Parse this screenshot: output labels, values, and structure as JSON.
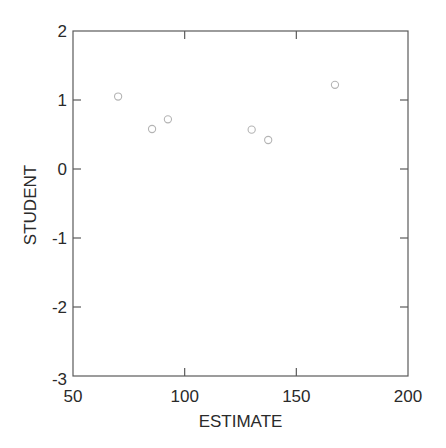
{
  "chart_data": {
    "type": "scatter",
    "title": "",
    "xlabel": "ESTIMATE",
    "ylabel": "STUDENT",
    "xlim": [
      50,
      200
    ],
    "ylim": [
      -3,
      2
    ],
    "xticks": [
      50,
      100,
      150,
      200
    ],
    "yticks": [
      2,
      1,
      0,
      -1,
      -2,
      -3
    ],
    "xtick_labels": [
      "50",
      "100",
      "150",
      "200"
    ],
    "ytick_labels": [
      "2",
      "1",
      "0",
      "-1",
      "-2",
      "-3"
    ],
    "grid": false,
    "legend": null,
    "marker": "open-circle",
    "marker_color": "#b4b4b4",
    "series": [
      {
        "name": "residuals",
        "points": [
          {
            "x": 70.2,
            "y": 1.05
          },
          {
            "x": 85.4,
            "y": 0.58
          },
          {
            "x": 92.5,
            "y": 0.72
          },
          {
            "x": 130.0,
            "y": 0.57
          },
          {
            "x": 137.4,
            "y": 0.42
          },
          {
            "x": 167.3,
            "y": 1.22
          }
        ]
      }
    ]
  },
  "colors": {
    "frame": "#5a5a5a",
    "text": "#2a2a2a",
    "marker": "#b4b4b4",
    "background": "#ffffff"
  }
}
